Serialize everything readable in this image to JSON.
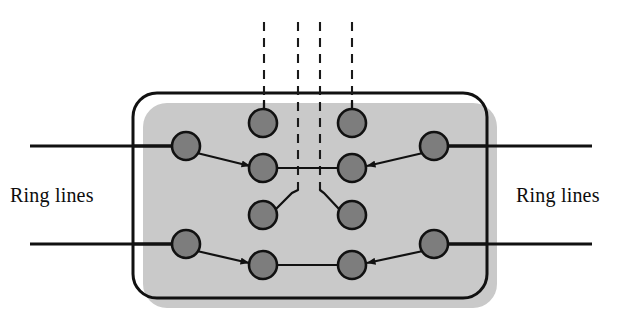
{
  "figure": {
    "title_clipped": "Spare capacity",
    "labels": {
      "left": "Ring lines",
      "right": "Ring lines"
    },
    "colors": {
      "node_fill": "#7d7d7d",
      "node_stroke": "#111111",
      "line": "#111111",
      "shadow": "#c9c9c9",
      "background": "#ffffff",
      "text": "#0d0d0d"
    },
    "box": {
      "x": 133,
      "y": 93,
      "width": 354,
      "height": 205,
      "corner_radius": 24,
      "stroke_width": 3,
      "shadow_offset_x": 10,
      "shadow_offset_y": 10
    },
    "nodes": [
      {
        "id": "ring-left-upper",
        "cx": 186,
        "cy": 146,
        "r": 14
      },
      {
        "id": "ring-left-lower",
        "cx": 186,
        "cy": 244,
        "r": 14
      },
      {
        "id": "ring-right-upper",
        "cx": 434,
        "cy": 146,
        "r": 14
      },
      {
        "id": "ring-right-lower",
        "cx": 434,
        "cy": 244,
        "r": 14
      },
      {
        "id": "inner-left-top",
        "cx": 263,
        "cy": 123,
        "r": 14
      },
      {
        "id": "inner-right-top",
        "cx": 352,
        "cy": 123,
        "r": 14
      },
      {
        "id": "inner-left-mid",
        "cx": 263,
        "cy": 168,
        "r": 14
      },
      {
        "id": "inner-right-mid",
        "cx": 352,
        "cy": 168,
        "r": 14
      },
      {
        "id": "inner-left-low",
        "cx": 263,
        "cy": 215,
        "r": 14
      },
      {
        "id": "inner-right-low",
        "cx": 352,
        "cy": 215,
        "r": 14
      },
      {
        "id": "inner-left-bottom",
        "cx": 263,
        "cy": 265,
        "r": 14
      },
      {
        "id": "inner-right-bottom",
        "cx": 352,
        "cy": 265,
        "r": 14
      }
    ],
    "ring_lines": [
      {
        "id": "ring-line-top-left",
        "x1": 30,
        "y1": 146,
        "x2": 186,
        "y2": 146
      },
      {
        "id": "ring-line-top-right",
        "x1": 434,
        "y1": 146,
        "x2": 592,
        "y2": 146
      },
      {
        "id": "ring-line-bottom-left",
        "x1": 30,
        "y1": 244,
        "x2": 186,
        "y2": 244
      },
      {
        "id": "ring-line-bottom-right",
        "x1": 434,
        "y1": 244,
        "x2": 592,
        "y2": 244
      }
    ],
    "dashed_lines": [
      {
        "id": "dashed-1",
        "x": 264,
        "y1": 22,
        "y2": 110
      },
      {
        "id": "dashed-2",
        "x": 298,
        "y1": 22,
        "y2": 190
      },
      {
        "id": "dashed-3",
        "x": 320,
        "y1": 22,
        "y2": 190
      },
      {
        "id": "dashed-4",
        "x": 352,
        "y1": 22,
        "y2": 110
      }
    ],
    "connections": [
      {
        "id": "link-mid-horizontal",
        "type": "plain",
        "from": "inner-left-mid",
        "to": "inner-right-mid"
      },
      {
        "id": "link-bottom-horizontal",
        "type": "plain",
        "from": "inner-left-bottom",
        "to": "inner-right-bottom"
      },
      {
        "id": "arrow-top-left",
        "type": "arrow",
        "from": "ring-left-upper",
        "to": "inner-left-mid"
      },
      {
        "id": "arrow-top-right",
        "type": "arrow",
        "from": "ring-right-upper",
        "to": "inner-right-mid"
      },
      {
        "id": "arrow-bottom-left",
        "type": "arrow",
        "from": "ring-left-lower",
        "to": "inner-left-bottom"
      },
      {
        "id": "arrow-bottom-right",
        "type": "arrow",
        "from": "ring-right-lower",
        "to": "inner-right-bottom"
      },
      {
        "id": "stub-left-low",
        "type": "plain",
        "from": "inner-left-low",
        "to": "dashed-2"
      },
      {
        "id": "stub-right-low",
        "type": "plain",
        "from": "inner-right-low",
        "to": "dashed-3"
      }
    ]
  }
}
